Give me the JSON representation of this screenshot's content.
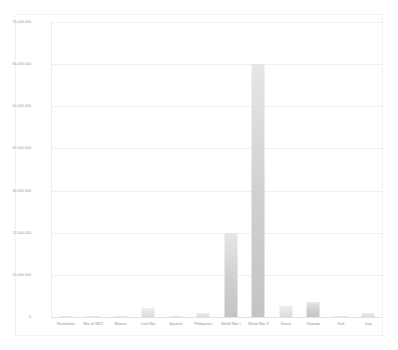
{
  "chart_data": {
    "type": "bar",
    "title": "",
    "xlabel": "",
    "ylabel": "",
    "ylim": [
      0,
      70000000
    ],
    "grid": true,
    "legend": "none",
    "categories": [
      "Revolution",
      "War of 1812",
      "Mexico",
      "Civil War",
      "Spanish",
      "Philippines",
      "World War I",
      "World War II",
      "Korea",
      "Vietnam",
      "Gulf",
      "Iraq"
    ],
    "values": [
      217000,
      286730,
      78718,
      2213363,
      306760,
      1000000,
      20000000,
      60000000,
      2500000,
      3500000,
      60000,
      1000000
    ],
    "ytick_labels": [
      "70,000,000",
      "60,000,000",
      "50,000,000",
      "40,000,000",
      "30,000,000",
      "20,000,000",
      "10,000,000",
      "0"
    ],
    "ytick_values": [
      70000000,
      60000000,
      50000000,
      40000000,
      30000000,
      20000000,
      10000000,
      0
    ],
    "bar_color": "#cfcfcf",
    "gridline_color": "#f0f0f0",
    "axis_color": "#e2e2e2",
    "tick_text_color": "#9a9a9a"
  }
}
